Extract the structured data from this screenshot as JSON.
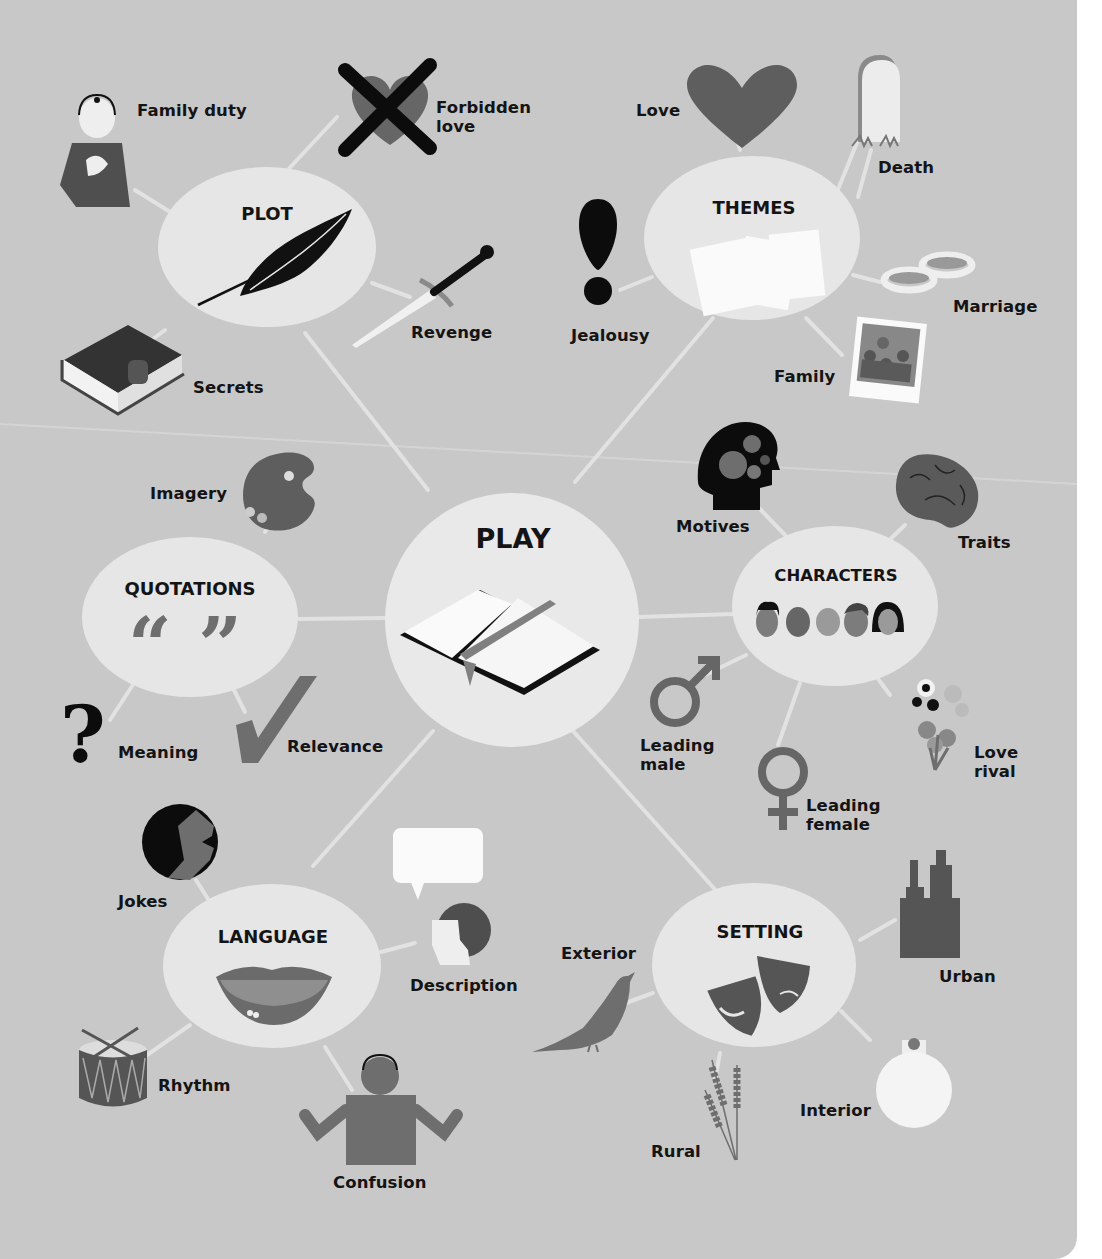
{
  "colors": {
    "background": "#c8c8c8",
    "node_fill": "#e6e6e6",
    "center_fill": "#e9e9e9",
    "connector": "#e2e2e2",
    "icon_dark": "#111111",
    "icon_mid": "#6e6e6e",
    "icon_light": "#f2f2f2",
    "text": "#141414"
  },
  "diagram": {
    "type": "mind-map",
    "center": {
      "id": "play",
      "label": "PLAY",
      "icon": "open-book-icon"
    },
    "hubs": [
      {
        "id": "plot",
        "label": "PLOT",
        "icon": "quill-feather-icon",
        "children": [
          {
            "label": "Family duty",
            "icon": "person-hand-on-heart-icon"
          },
          {
            "label": "Forbidden\nlove",
            "icon": "crossed-out-heart-icon"
          },
          {
            "label": "Revenge",
            "icon": "dagger-icon"
          },
          {
            "label": "Secrets",
            "icon": "locked-book-icon"
          }
        ]
      },
      {
        "id": "themes",
        "label": "THEMES",
        "icon": "paper-sheets-icon",
        "children": [
          {
            "label": "Love",
            "icon": "heart-icon"
          },
          {
            "label": "Death",
            "icon": "gravestone-icon"
          },
          {
            "label": "Marriage",
            "icon": "wedding-rings-icon"
          },
          {
            "label": "Family",
            "icon": "family-photo-icon"
          },
          {
            "label": "Jealousy",
            "icon": "exclamation-icon"
          }
        ]
      },
      {
        "id": "quotations",
        "label": "QUOTATIONS",
        "icon": "quotation-marks-icon",
        "children": [
          {
            "label": "Imagery",
            "icon": "paint-palette-icon"
          },
          {
            "label": "Meaning",
            "icon": "question-mark-icon"
          },
          {
            "label": "Relevance",
            "icon": "checkmark-icon"
          }
        ]
      },
      {
        "id": "characters",
        "label": "CHARACTERS",
        "icon": "faces-group-icon",
        "children": [
          {
            "label": "Motives",
            "icon": "head-gears-icon"
          },
          {
            "label": "Traits",
            "icon": "brain-icon"
          },
          {
            "label": "Leading\nmale",
            "icon": "male-symbol-icon"
          },
          {
            "label": "Leading\nfemale",
            "icon": "female-symbol-icon"
          },
          {
            "label": "Love\nrival",
            "icon": "flower-bouquet-icon"
          }
        ]
      },
      {
        "id": "language",
        "label": "LANGUAGE",
        "icon": "mouth-lips-icon",
        "children": [
          {
            "label": "Jokes",
            "icon": "laughing-face-icon"
          },
          {
            "label": "Description",
            "icon": "speaking-head-icon"
          },
          {
            "label": "Rhythm",
            "icon": "drum-icon"
          },
          {
            "label": "Confusion",
            "icon": "shrugging-person-icon"
          }
        ]
      },
      {
        "id": "setting",
        "label": "SETTING",
        "icon": "theatre-masks-icon",
        "children": [
          {
            "label": "Exterior",
            "icon": "bird-icon"
          },
          {
            "label": "Urban",
            "icon": "skyscrapers-icon"
          },
          {
            "label": "Interior",
            "icon": "light-bulb-icon"
          },
          {
            "label": "Rural",
            "icon": "wheat-icon"
          }
        ]
      }
    ]
  }
}
